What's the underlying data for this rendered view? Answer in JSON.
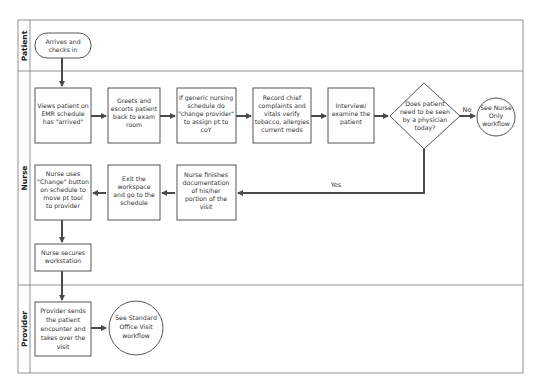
{
  "lanes": {
    "patient": "Patient",
    "nurse": "Nurse",
    "provider": "Provider"
  },
  "nodes": {
    "arrives": [
      "Arrives and",
      "checks in"
    ],
    "views": [
      "Views patient on",
      "EMR schedule",
      "has \"arrived\""
    ],
    "greets": [
      "Greets and",
      "escorts patient",
      "back to exam",
      "room"
    ],
    "generic": [
      "If generic nursing",
      "schedule do",
      "\"change provider\"",
      "to assign pt to",
      "coY"
    ],
    "record": [
      "Record chief",
      "complaints and",
      "vitals verify",
      "tobacco, allergies",
      "current meds"
    ],
    "interview": [
      "Interview/",
      "examine the",
      "patient"
    ],
    "decision": [
      "Does patient",
      "need to be seen",
      "by a physician",
      "today?"
    ],
    "nurse_only": [
      "See Nurse",
      "Only",
      "workflow"
    ],
    "finishes": [
      "Nurse finishes",
      "documentation",
      "of his/her",
      "portion of the",
      "visit"
    ],
    "exit": [
      "Exit the",
      "workspace",
      "and go to the",
      "schedule"
    ],
    "change": [
      "Nurse uses",
      "\"Change\" button",
      "on schedule to",
      "move pt tool",
      "to provider"
    ],
    "secures": [
      "Nurse secures",
      "workstation"
    ],
    "provider_sends": [
      "Provider sends",
      "the patient",
      "encounter and",
      "takes over the",
      "visit"
    ],
    "standard": [
      "See Standard",
      "Office Visit",
      "workflow"
    ]
  },
  "edge_labels": {
    "no": "No",
    "yes": "Yes"
  },
  "colors": {
    "line": "#555555",
    "arrow": "#4a4a4a",
    "text": "#333333"
  }
}
